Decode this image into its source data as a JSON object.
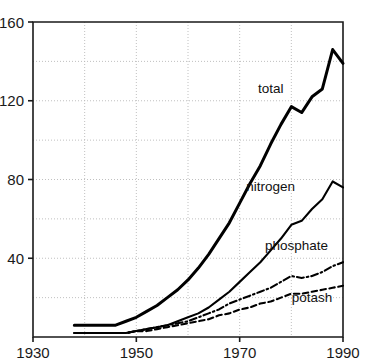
{
  "chart_data": {
    "type": "line",
    "title": "",
    "subtitle": "",
    "xlabel": "",
    "ylabel": "",
    "xlim": [
      1930,
      1990
    ],
    "ylim": [
      0,
      160
    ],
    "grid": true,
    "legend_position": "inline-labels",
    "x_ticks": [
      1930,
      1950,
      1970,
      1990
    ],
    "x_tick_labels": [
      "1930",
      "1950",
      "1970",
      "1990"
    ],
    "x_minor_gridlines": [
      1940,
      1950,
      1960,
      1970,
      1980,
      1990
    ],
    "y_ticks": [
      40,
      80,
      120,
      160
    ],
    "y_tick_labels": [
      "40",
      "80",
      "120",
      "160"
    ],
    "y_minor_gridlines": [
      20,
      60,
      100,
      140
    ],
    "x": [
      1938,
      1940,
      1942,
      1944,
      1946,
      1948,
      1950,
      1952,
      1954,
      1956,
      1958,
      1960,
      1962,
      1964,
      1966,
      1968,
      1970,
      1972,
      1974,
      1976,
      1978,
      1980,
      1982,
      1984,
      1986,
      1988,
      1990
    ],
    "series": [
      {
        "name": "total",
        "label": "total",
        "style": "solid-thick",
        "values": [
          6,
          6,
          6,
          6,
          6,
          8,
          10,
          13,
          16,
          20,
          24,
          29,
          35,
          42,
          50,
          58,
          68,
          78,
          87,
          98,
          108,
          117,
          114,
          122,
          126,
          146,
          139
        ]
      },
      {
        "name": "nitrogen",
        "label": "nitrogen",
        "style": "solid",
        "values": [
          2,
          2,
          2,
          2,
          2,
          2,
          3,
          4,
          5,
          6,
          8,
          10,
          12,
          15,
          19,
          23,
          28,
          33,
          38,
          44,
          50,
          57,
          59,
          65,
          70,
          79,
          76
        ]
      },
      {
        "name": "phosphate",
        "label": "phosphate",
        "style": "dash-dot",
        "values": [
          2,
          2,
          2,
          2,
          2,
          2,
          3,
          4,
          5,
          6,
          7,
          8,
          10,
          12,
          14,
          17,
          19,
          21,
          23,
          25,
          28,
          31,
          30,
          31,
          33,
          36,
          38
        ]
      },
      {
        "name": "potash",
        "label": "potash",
        "style": "dashed",
        "values": [
          2,
          2,
          2,
          2,
          2,
          2,
          3,
          3,
          4,
          5,
          6,
          7,
          8,
          9,
          11,
          12,
          14,
          15,
          17,
          18,
          20,
          22,
          22,
          23,
          24,
          25,
          26
        ]
      }
    ],
    "annotations": [
      {
        "text": "total",
        "x": 1976,
        "y": 124
      },
      {
        "text": "nitrogen",
        "x": 1976,
        "y": 74
      },
      {
        "text": "phosphate",
        "x": 1981,
        "y": 44
      },
      {
        "text": "potash",
        "x": 1984,
        "y": 18
      }
    ],
    "colors": {
      "background": "#ffffff",
      "axis": "#1a1a1a",
      "grid": "#b9b9b9",
      "series": "#000000",
      "text": "#1a1a1a"
    }
  }
}
